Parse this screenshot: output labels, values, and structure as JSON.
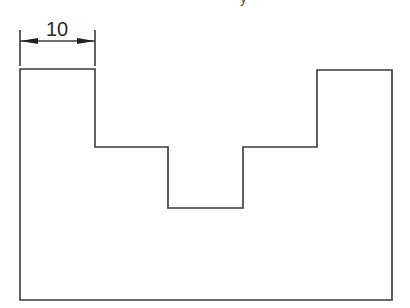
{
  "diagram": {
    "type": "technical-drawing",
    "cut_text_fragment": "y",
    "dimension": {
      "label": "10",
      "from_x": 20,
      "to_x": 95,
      "line_y": 41
    },
    "outline_points": [
      [
        20,
        69
      ],
      [
        95,
        69
      ],
      [
        95,
        147
      ],
      [
        168,
        147
      ],
      [
        168,
        208
      ],
      [
        243,
        208
      ],
      [
        243,
        147
      ],
      [
        317,
        147
      ],
      [
        317,
        70
      ],
      [
        392,
        70
      ],
      [
        392,
        300
      ],
      [
        20,
        300
      ]
    ],
    "colors": {
      "line": "#3a3a3a",
      "background": "#ffffff"
    }
  }
}
